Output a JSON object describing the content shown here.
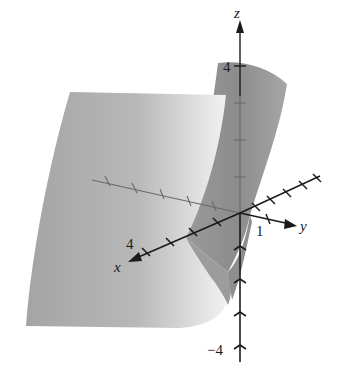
{
  "figure": {
    "type": "3d-surface-plot",
    "axes": {
      "x": {
        "label": "x",
        "tick_label": "4",
        "ticks": 4
      },
      "y": {
        "label": "y",
        "tick_label": "1",
        "ticks": 1
      },
      "z": {
        "label": "z",
        "tick_label_top": "4",
        "tick_label_bottom": "−4",
        "ticks_each_side": 4
      }
    },
    "colors": {
      "surface_dark": "#8a8a8a",
      "surface_mid": "#a8a8a8",
      "surface_light": "#e2e2e2",
      "axis": "#1a1a1a",
      "hidden_axis": "#6a6a6a"
    }
  }
}
